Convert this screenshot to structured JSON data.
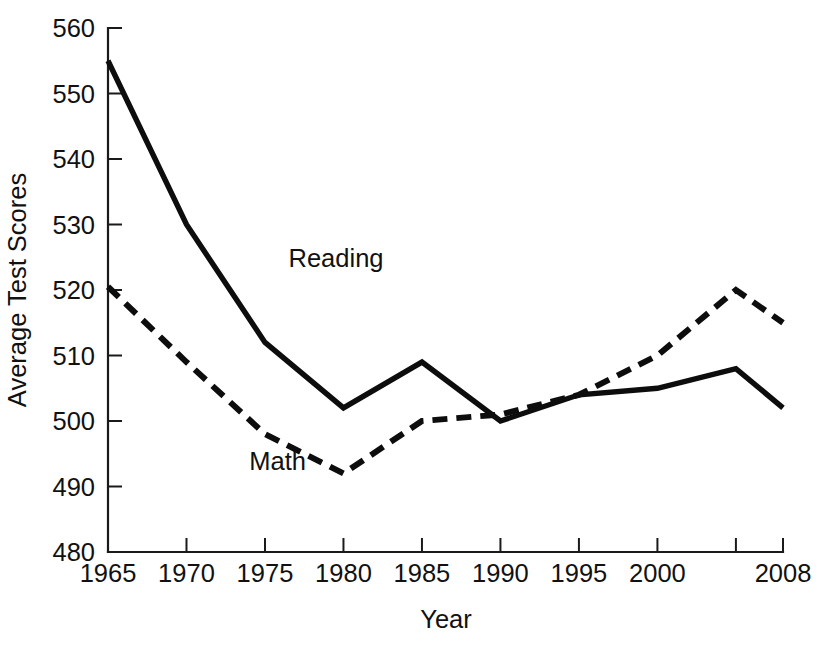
{
  "chart_data": {
    "type": "line",
    "title": "",
    "xlabel": "Year",
    "ylabel": "Average Test Scores",
    "x": [
      1965,
      1970,
      1975,
      1980,
      1985,
      1990,
      1995,
      2000,
      2005,
      2008
    ],
    "xlim": [
      1965,
      2008
    ],
    "ylim": [
      480,
      560
    ],
    "grid": false,
    "legend_position": "inline-annotations",
    "x_ticks": [
      1965,
      1970,
      1975,
      1980,
      1985,
      1990,
      1995,
      2000,
      2005,
      2008
    ],
    "x_tick_labels": [
      "1965",
      "1970",
      "1975",
      "1980",
      "1985",
      "1990",
      "1995",
      "2000",
      "",
      "2008"
    ],
    "y_ticks": [
      480,
      490,
      500,
      510,
      520,
      530,
      540,
      550,
      560
    ],
    "y_tick_labels": [
      "480",
      "490",
      "500",
      "510",
      "520",
      "530",
      "540",
      "550",
      "560"
    ],
    "series": [
      {
        "name": "Reading",
        "style": "solid",
        "color": "#0d0d0d",
        "label_x": 1976.5,
        "label_y": 523.5,
        "values": [
          555,
          530,
          512,
          502,
          509,
          500,
          504,
          505,
          508,
          502
        ]
      },
      {
        "name": "Math",
        "style": "dashed",
        "color": "#0d0d0d",
        "label_x": 1974.0,
        "label_y": 492.5,
        "values": [
          520.5,
          509,
          498,
          492,
          500,
          501,
          504,
          510,
          520,
          515
        ]
      }
    ]
  },
  "axes": {
    "x_axis_title": "Year",
    "y_axis_title": "Average Test Scores"
  }
}
